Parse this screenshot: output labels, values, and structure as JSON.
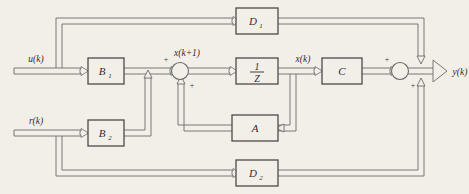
{
  "diagram": {
    "type": "control-block-diagram",
    "background_color": "#f2efe9",
    "line_color": "#6b6b6b",
    "box_border_color": "#4a4a4a",
    "box_fill_color": "#f2efe9",
    "text_color": "#2e2e2e"
  },
  "inputs": [
    {
      "id": "u",
      "label": "u(k)",
      "label_base": "u",
      "label_arg": "(k)"
    },
    {
      "id": "r",
      "label": "r(k)",
      "label_base": "r",
      "label_arg": "(k)"
    }
  ],
  "outputs": [
    {
      "id": "y",
      "label": "y(k)",
      "label_base": "y",
      "label_arg": "(k)"
    }
  ],
  "signals": [
    {
      "id": "x_next",
      "label": "x(k+1)",
      "label_base": "x",
      "label_arg": "(k+1)"
    },
    {
      "id": "x_state",
      "label": "x(k)",
      "label_base": "x",
      "label_arg": "(k)"
    }
  ],
  "blocks": [
    {
      "id": "D1",
      "label": "D",
      "subscript": "1",
      "full_label": "D1"
    },
    {
      "id": "B1",
      "label": "B",
      "subscript": "1",
      "full_label": "B1"
    },
    {
      "id": "B2",
      "label": "B",
      "subscript": "2",
      "full_label": "B2"
    },
    {
      "id": "delay",
      "label": "1/Z",
      "numerator": "1",
      "denominator": "Z"
    },
    {
      "id": "A",
      "label": "A",
      "subscript": "",
      "full_label": "A"
    },
    {
      "id": "C",
      "label": "C",
      "subscript": "",
      "full_label": "C"
    },
    {
      "id": "D2",
      "label": "D",
      "subscript": "2",
      "full_label": "D2"
    }
  ],
  "summing_junctions": [
    {
      "id": "state-summer",
      "signs": [
        {
          "id": "state-summer-plus-top",
          "symbol": "+"
        },
        {
          "id": "state-summer-plus-bottom",
          "symbol": "+"
        }
      ]
    },
    {
      "id": "output-summer",
      "signs": [
        {
          "id": "output-summer-plus-top",
          "symbol": "+"
        },
        {
          "id": "output-summer-plus-bottom",
          "symbol": "+"
        }
      ]
    }
  ]
}
